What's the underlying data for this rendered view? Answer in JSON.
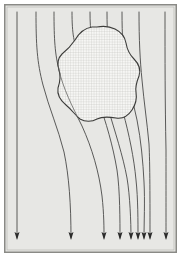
{
  "figure": {
    "caption": "",
    "width": 181,
    "height": 257
  },
  "colors": {
    "page_background": "#ffffff",
    "field_background": "#e7e7e4",
    "frame_border": "#8a8a86",
    "frame_inner_border": "#b9b9b5",
    "streamline": "#4a4a48",
    "arrow_fill": "#2b2b2a",
    "obstacle_outline": "#3c3c3a",
    "obstacle_fill": "#f4f4f2",
    "obstacle_hatch": "#c2c2be"
  },
  "frame": {
    "outer_margin": 4,
    "border_width": 1.5,
    "field": {
      "x": 6,
      "y": 6,
      "width": 169,
      "height": 245
    }
  },
  "obstacle": {
    "label": "impermeable-inclusion",
    "fill_pattern": "fine-cross-hatch-grid",
    "pattern_spacing": 2.6,
    "outline_width": 1.1,
    "bounds": {
      "x": 58,
      "y": 26,
      "width": 82,
      "height": 96
    },
    "path": "M 92 27 C 85 28 79 33 75 40 C 71 46 67 50 62 54 C 58 58 57 64 59 70 C 61 76 60 82 58 88 C 57 94 60 100 66 105 C 72 110 75 115 80 119 C 85 122 92 122 97 119 C 103 116 110 117 116 118 C 122 119 128 116 132 110 C 136 104 137 98 136 92 C 135 86 137 81 139 76 C 141 70 139 64 134 59 C 129 54 127 49 126 43 C 125 37 121 32 115 29 C 109 26 102 26 97 27 Z"
  },
  "streamlines": {
    "count": 9,
    "stroke_width": 0.9,
    "description": "Vertical flow lines entering at top, deflecting around the obstacle and converging below it",
    "lines": [
      {
        "id": "streamline-1",
        "top_x": 17,
        "bottom_x": 17,
        "arrow_x": 17,
        "path": "M 17 12 L 17 150 L 17 238"
      },
      {
        "id": "streamline-2",
        "top_x": 36,
        "bottom_x": 71,
        "arrow_x": 71,
        "path": "M 36 12 C 36 45 37 62 43 85 C 49 108 58 128 64 152 C 69 176 71 204 71 238"
      },
      {
        "id": "streamline-3",
        "top_x": 54,
        "bottom_x": 104,
        "arrow_x": 104,
        "path": "M 54 12 C 54 40 55 54 59 70 C 63 88 72 106 82 126 C 92 148 99 172 102 196 C 104 214 104 228 104 238"
      },
      {
        "id": "streamline-4",
        "top_x": 72,
        "bottom_x": 120,
        "arrow_x": 120,
        "path": "M 72 12 C 72 34 74 44 79 54 C 85 66 91 82 98 100 C 106 122 113 146 117 170 C 120 190 120 222 120 238"
      },
      {
        "id": "streamline-5",
        "top_x": 90,
        "bottom_x": 131,
        "arrow_x": 131,
        "path": "M 90 12 C 90 32 92 44 95 58 C 99 74 103 90 108 108 C 115 132 123 156 127 178 C 130 196 131 222 131 238"
      },
      {
        "id": "streamline-6",
        "top_x": 107,
        "bottom_x": 138,
        "arrow_x": 138,
        "path": "M 107 12 C 107 34 108 48 111 62 C 114 78 118 94 123 112 C 129 134 134 158 136 180 C 138 198 138 222 138 238"
      },
      {
        "id": "streamline-7",
        "top_x": 122,
        "bottom_x": 144,
        "arrow_x": 144,
        "path": "M 122 12 C 122 36 123 52 126 68 C 129 86 133 102 137 120 C 141 140 143 162 144 182 C 145 200 144 224 144 238"
      },
      {
        "id": "streamline-8",
        "top_x": 139,
        "bottom_x": 150,
        "arrow_x": 150,
        "path": "M 139 12 C 139 40 140 60 142 80 C 144 102 147 122 149 144 C 150 164 150 200 150 238"
      },
      {
        "id": "streamline-9",
        "top_x": 165,
        "bottom_x": 166,
        "arrow_x": 166,
        "path": "M 165 12 C 165 60 165 100 166 150 C 166 190 166 220 166 238"
      }
    ]
  },
  "arrows": {
    "label": "flow-direction-arrowheads",
    "direction": "downward",
    "head_width": 5,
    "head_length": 8,
    "tip_y": 240,
    "positions": [
      17,
      71,
      104,
      120,
      131,
      138,
      144,
      150,
      166
    ]
  }
}
